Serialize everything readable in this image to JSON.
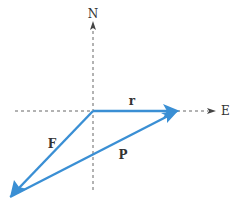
{
  "diagram": {
    "type": "vector-addition",
    "colors": {
      "vector": "#3a8fd4",
      "axis": "#555555",
      "label": "#333333",
      "background": "#ffffff"
    },
    "axes": {
      "north_label": "N",
      "east_label": "E"
    },
    "vectors": [
      {
        "name": "r",
        "label": "r",
        "from": "origin",
        "to": "east-tip",
        "direction": "east"
      },
      {
        "name": "F",
        "label": "F",
        "from": "origin",
        "to": "southwest-tip",
        "direction": "southwest"
      },
      {
        "name": "P",
        "label": "P",
        "from": "southwest-tip",
        "to": "east-tip",
        "direction": "northeast"
      }
    ]
  }
}
